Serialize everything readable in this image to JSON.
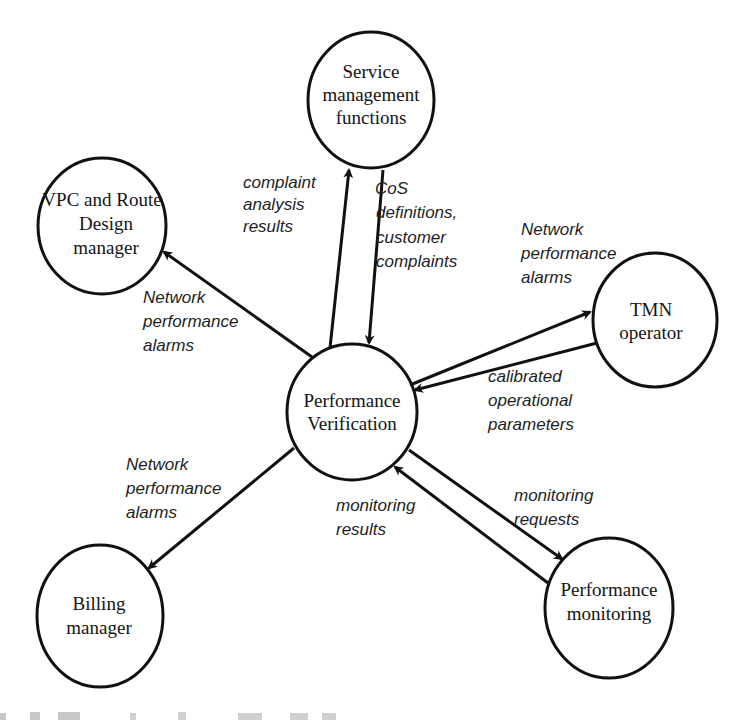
{
  "diagram": {
    "nodes": [
      {
        "id": "service",
        "lines": [
          "Service",
          "management",
          "functions"
        ],
        "cx": 371,
        "cy": 100,
        "rx": 63,
        "ry": 68
      },
      {
        "id": "vpc",
        "lines": [
          "VPC and Route",
          "Design",
          "manager"
        ],
        "cx": 102,
        "cy": 226,
        "rx": 64,
        "ry": 68
      },
      {
        "id": "tmn",
        "lines": [
          "TMN",
          "operator"
        ],
        "cx": 655,
        "cy": 320,
        "rx": 62,
        "ry": 67
      },
      {
        "id": "verification",
        "lines": [
          "Performance",
          "Verification"
        ],
        "cx": 352,
        "cy": 412,
        "rx": 65,
        "ry": 68
      },
      {
        "id": "billing",
        "lines": [
          "Billing",
          "manager"
        ],
        "cx": 100,
        "cy": 616,
        "rx": 63,
        "ry": 71
      },
      {
        "id": "monitoring",
        "lines": [
          "Performance",
          "monitoring"
        ],
        "cx": 609,
        "cy": 608,
        "rx": 64,
        "ry": 70
      }
    ],
    "edges": [
      {
        "id": "verif-to-service",
        "from": "verification",
        "to": "service",
        "label": [
          "complaint",
          "analysis",
          "results"
        ]
      },
      {
        "id": "service-to-verif",
        "from": "service",
        "to": "verification",
        "label": [
          "CoS",
          "definitions,",
          "customer",
          "complaints"
        ]
      },
      {
        "id": "verif-to-vpc",
        "from": "verification",
        "to": "vpc",
        "label": [
          "Network",
          "performance",
          "alarms"
        ]
      },
      {
        "id": "verif-to-tmn",
        "from": "verification",
        "to": "tmn",
        "label": [
          "Network",
          "performance",
          "alarms"
        ]
      },
      {
        "id": "tmn-to-verif",
        "from": "tmn",
        "to": "verification",
        "label": [
          "calibrated",
          "operational",
          "parameters"
        ]
      },
      {
        "id": "verif-to-billing",
        "from": "verification",
        "to": "billing",
        "label": [
          "Network",
          "performance",
          "alarms"
        ]
      },
      {
        "id": "verif-to-monitoring",
        "from": "verification",
        "to": "monitoring",
        "label": [
          "monitoring",
          "requests"
        ]
      },
      {
        "id": "monitoring-to-verif",
        "from": "monitoring",
        "to": "verification",
        "label": [
          "monitoring",
          "results"
        ]
      }
    ],
    "caption_partial": "(caption text cut off at bottom edge)"
  }
}
